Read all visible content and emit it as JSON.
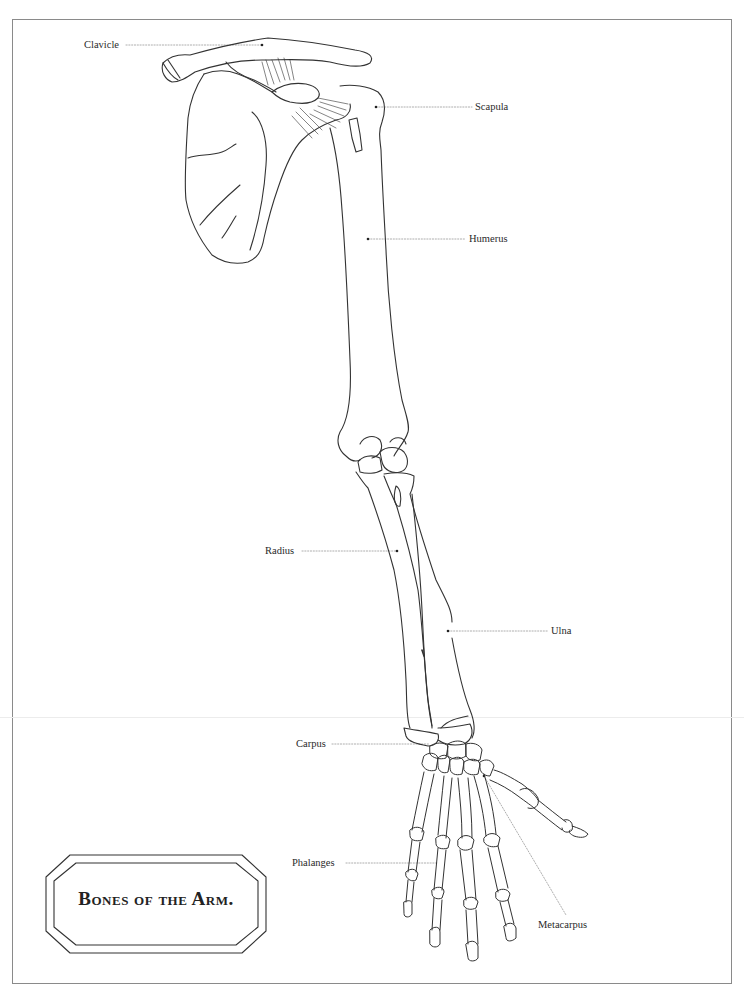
{
  "title": "Bones of the Arm.",
  "labels": {
    "clavicle": "Clavicle",
    "scapula": "Scapula",
    "humerus": "Humerus",
    "radius": "Radius",
    "ulna": "Ulna",
    "carpus": "Carpus",
    "phalanges": "Phalanges",
    "metacarpus": "Metacarpus"
  },
  "colors": {
    "line": "#333333",
    "leader": "#9a9a9a",
    "frame": "#8a8a8a",
    "background": "#ffffff"
  }
}
